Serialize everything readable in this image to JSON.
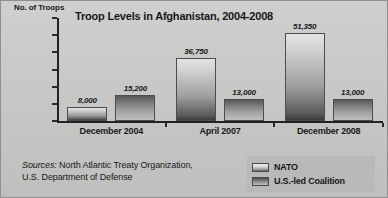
{
  "chart_data": {
    "type": "bar",
    "title": "Troop Levels in Afghanistan, 2004-2008",
    "ylabel": "No. of Troops",
    "xlabel": "",
    "categories": [
      "December 2004",
      "April 2007",
      "December 2008"
    ],
    "series": [
      {
        "name": "NATO",
        "values": [
          8000,
          36750,
          51350
        ],
        "labels": [
          "8,000",
          "36,750",
          "51,350"
        ],
        "color": "#c0c0be"
      },
      {
        "name": "U.S.-led Coalition",
        "values": [
          15200,
          13000,
          13000
        ],
        "labels": [
          "15,200",
          "13,000",
          "13,000"
        ],
        "color": "#87878a"
      }
    ],
    "ylim": [
      0,
      60000
    ],
    "yticks": [
      0,
      10000,
      20000,
      30000,
      40000,
      50000,
      60000
    ],
    "ytick_labels": [
      "0",
      "10,000",
      "20,000",
      "30,000",
      "40,000",
      "50,000",
      "60,000"
    ],
    "grid": false,
    "legend_position": "bottom-right"
  },
  "sources": {
    "label": "Sources:",
    "line1": " North Atlantic Treaty Organization,",
    "line2": "U.S. Department of Defense"
  },
  "legend": {
    "items": [
      {
        "label": "NATO",
        "swatch": "nato-swatch-icon"
      },
      {
        "label": "U.S.-led Coalition",
        "swatch": "coalition-swatch-icon"
      }
    ]
  }
}
